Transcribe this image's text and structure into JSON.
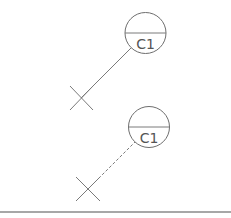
{
  "diagram": {
    "symbols": [
      {
        "name": "callout-tag-solid-leader",
        "tag_label": "C1",
        "leader_style": "solid",
        "marker": "x-cross"
      },
      {
        "name": "callout-tag-dashed-leader",
        "tag_label": "C1",
        "leader_style": "dashed",
        "marker": "x-cross"
      }
    ],
    "colors": {
      "line": "#7a7a7a",
      "circle": "#6e6e6e",
      "text": "#555555",
      "rule": "#8a8a8a",
      "background": "#ffffff"
    }
  }
}
